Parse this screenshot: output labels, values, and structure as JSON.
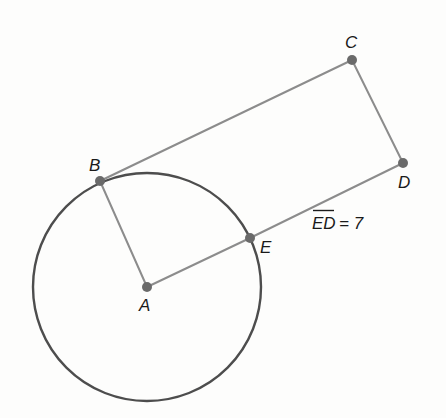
{
  "diagram": {
    "type": "geometry",
    "circle": {
      "center": "A",
      "cx": 147,
      "cy": 287,
      "r": 114,
      "stroke": "#4d4d4d"
    },
    "points": [
      {
        "id": "A",
        "label": "A",
        "x": 147,
        "y": 287,
        "lx": 139,
        "ly": 311
      },
      {
        "id": "B",
        "label": "B",
        "x": 100,
        "y": 181,
        "lx": 89,
        "ly": 171
      },
      {
        "id": "C",
        "label": "C",
        "x": 352,
        "y": 60,
        "lx": 345,
        "ly": 48
      },
      {
        "id": "D",
        "label": "D",
        "x": 403,
        "y": 163,
        "lx": 398,
        "ly": 188
      },
      {
        "id": "E",
        "label": "E",
        "x": 250,
        "y": 238,
        "lx": 260,
        "ly": 253
      }
    ],
    "segments": [
      {
        "from": "A",
        "to": "B"
      },
      {
        "from": "B",
        "to": "C"
      },
      {
        "from": "C",
        "to": "D"
      },
      {
        "from": "A",
        "to": "E"
      },
      {
        "from": "E",
        "to": "D"
      }
    ],
    "measurement": {
      "segment": "ED",
      "overline_text": "ED",
      "text": "ED = 7",
      "equals": "= 7",
      "value": 7
    },
    "colors": {
      "segment": "#8c8c8c",
      "circle": "#4d4d4d",
      "point": "#6a6a6a",
      "label": "#1a1a1a"
    }
  }
}
